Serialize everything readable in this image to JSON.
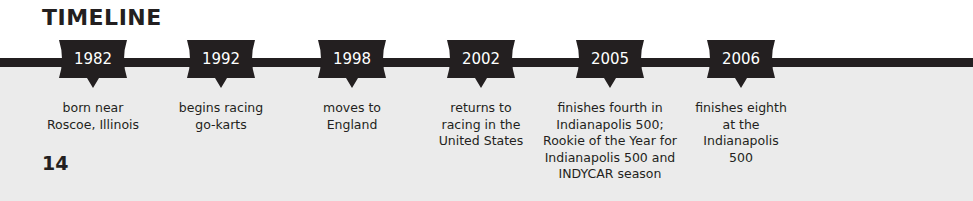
{
  "page": {
    "title": "TIMELINE",
    "page_number": "14"
  },
  "colors": {
    "ink": "#231f20",
    "badge_text": "#ffffff",
    "background_top": "#ffffff",
    "background_bottom": "#ebebeb"
  },
  "timeline": {
    "events": [
      {
        "year": "1982",
        "description": "born near\nRoscoe, Illinois"
      },
      {
        "year": "1992",
        "description": "begins racing\ngo-karts"
      },
      {
        "year": "1998",
        "description": "moves to\nEngland"
      },
      {
        "year": "2002",
        "description": "returns to\nracing in the\nUnited States"
      },
      {
        "year": "2005",
        "description": "finishes fourth in\nIndianapolis 500;\nRookie of the Year for\nIndianapolis 500 and\nINDYCAR season"
      },
      {
        "year": "2006",
        "description": "finishes eighth\nat the\nIndianapolis\n500"
      }
    ]
  }
}
